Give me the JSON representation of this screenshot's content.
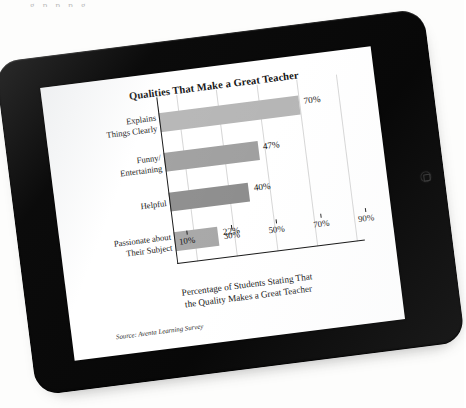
{
  "scan": {
    "page_text_sliver": "g p       p       p        g"
  },
  "device": {
    "type": "tablet",
    "orientation": "landscape",
    "bezel_color": "#0a0a0a",
    "home_button_label": "Home"
  },
  "figure": {
    "title": "Qualities That Make a Great Teacher",
    "x_axis_title_line1": "Percentage of Students Stating That",
    "x_axis_title_line2": "the Quality Makes a Great Teacher",
    "source": "Source: Aventa Learning Survey"
  },
  "chart_data": {
    "type": "bar",
    "orientation": "horizontal",
    "title": "Qualities That Make a Great Teacher",
    "xlabel": "Percentage of Students Stating That the Quality Makes a Great Teacher",
    "ylabel": "",
    "categories": [
      "Explains Things Clearly",
      "Funny/ Entertaining",
      "Helpful",
      "Passionate about Their Subject"
    ],
    "category_lines": [
      [
        "Explains",
        "Things Clearly"
      ],
      [
        "Funny/",
        "Entertaining"
      ],
      [
        "Helpful",
        ""
      ],
      [
        "Passionate about",
        "Their Subject"
      ]
    ],
    "values": [
      70,
      47,
      40,
      22
    ],
    "value_labels": [
      "70%",
      "47%",
      "40%",
      "22%"
    ],
    "bar_colors": [
      "#b6b6b6",
      "#a0a0a0",
      "#8e8e8e",
      "#a8a8a8"
    ],
    "xlim": [
      0,
      90
    ],
    "tick_values": [
      10,
      30,
      50,
      70,
      90
    ],
    "tick_labels": [
      "10%",
      "30%",
      "50%",
      "70%",
      "90%"
    ],
    "grid": true,
    "grid_axis": "x",
    "gridline_color": "#d6d6d6",
    "legend": false,
    "axis_color": "#1b1b1b"
  }
}
